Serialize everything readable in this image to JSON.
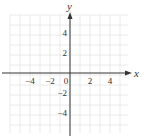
{
  "chart_data": {
    "type": "scatter",
    "title": "",
    "xlabel": "x",
    "ylabel": "y",
    "xlim": [
      -6,
      6
    ],
    "ylim": [
      -6,
      6
    ],
    "grid": true,
    "grid_step": 1,
    "x_ticks": [
      -4,
      -2,
      0,
      2,
      4
    ],
    "y_ticks": [
      4,
      2,
      -2,
      -4
    ],
    "x_tick_labels": [
      "−4",
      "−2",
      "0",
      "2",
      "4"
    ],
    "y_tick_labels": [
      "4",
      "2",
      "−2",
      "−4"
    ],
    "series": [],
    "legend": null
  },
  "colors": {
    "grid": "#e4e4e4",
    "axis": "#333333",
    "text": "#333333",
    "background": "#ffffff"
  },
  "layout": {
    "origin_px": [
      70,
      73
    ],
    "unit_px": 10,
    "grid_left_px": 10,
    "grid_right_px": 128,
    "grid_top_px": 15,
    "grid_bottom_px": 133
  }
}
